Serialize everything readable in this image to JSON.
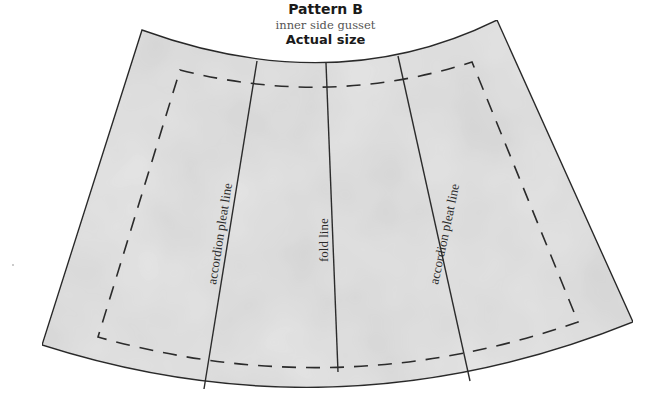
{
  "header": {
    "title": "Pattern B",
    "subtitle": "inner side gusset",
    "size_note": "Actual size"
  },
  "pattern": {
    "piece_fill": "#e4e4e4",
    "outline_color": "#2b2b2b",
    "lines": [
      {
        "id": "left-pleat",
        "label": "accordion pleat line"
      },
      {
        "id": "fold",
        "label": "fold line"
      },
      {
        "id": "right-pleat",
        "label": "accordion pleat line"
      }
    ],
    "seam_allowance": "dashed"
  }
}
